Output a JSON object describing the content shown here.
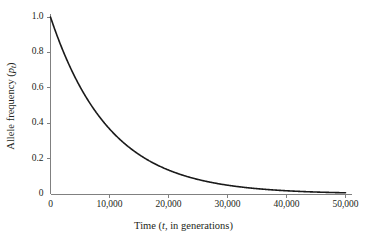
{
  "chart_data": {
    "type": "line",
    "title": "",
    "xlabel": "Time (t, in generations)",
    "ylabel": "Allele frequency (p_t)",
    "xlabel_parts": {
      "pre": "Time (",
      "italic": "t",
      "post": ", in generations)"
    },
    "ylabel_parts": {
      "pre": "Allele frequency (",
      "italic": "p",
      "subscript": "t",
      "post": ")"
    },
    "xlim": [
      0,
      50000
    ],
    "ylim": [
      0,
      1.0
    ],
    "xticks": [
      0,
      10000,
      20000,
      30000,
      40000,
      50000
    ],
    "xticklabels": [
      "0",
      "10,000",
      "20,000",
      "30,000",
      "40,000",
      "50,000"
    ],
    "yticks": [
      0,
      0.2,
      0.4,
      0.6,
      0.8,
      1.0
    ],
    "yticklabels": [
      "0",
      "0.2",
      "0.4",
      "0.6",
      "0.8",
      "1.0"
    ],
    "grid": false,
    "legend": null,
    "series": [
      {
        "name": "Allele frequency decay",
        "model": "p_t = p_0 * exp(-0.0001 * t)",
        "p0": 1.0,
        "decay_rate": 0.0001,
        "color": "#1a1a1a",
        "line_width": 1.6,
        "x": [
          0,
          1000,
          2000,
          3000,
          4000,
          5000,
          6000,
          7000,
          8000,
          9000,
          10000,
          12000,
          14000,
          16000,
          18000,
          20000,
          22000,
          24000,
          26000,
          28000,
          30000,
          33000,
          36000,
          39000,
          42000,
          45000,
          48000,
          50000
        ],
        "y": [
          1.0,
          0.905,
          0.819,
          0.741,
          0.67,
          0.607,
          0.549,
          0.497,
          0.449,
          0.407,
          0.368,
          0.301,
          0.247,
          0.202,
          0.165,
          0.135,
          0.111,
          0.091,
          0.074,
          0.061,
          0.05,
          0.037,
          0.027,
          0.02,
          0.015,
          0.011,
          0.008,
          0.007
        ]
      }
    ],
    "axis_color": "#808080",
    "background": "#ffffff"
  }
}
